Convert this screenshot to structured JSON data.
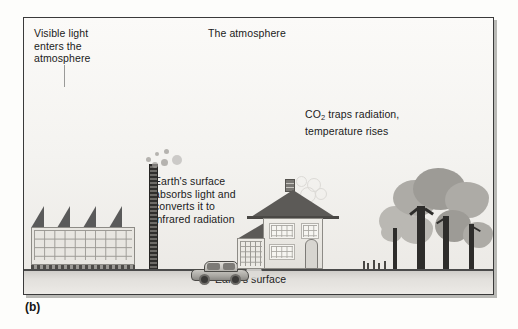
{
  "figure": {
    "caption": "(b)",
    "frame_color": "#3a3a3a",
    "sky_color": "#f7f6f3",
    "ground_color": "#dedcd8"
  },
  "labels": {
    "visible_light": "Visible light\nenters the\natmosphere",
    "atmosphere": "The atmosphere",
    "co2_prefix": "CO",
    "co2_subscript": "2",
    "co2_suffix": " traps radiation,\ntemperature rises",
    "absorb": "Earth's surface\nabsorbs light and\nconverts it to\ninfrared radiation",
    "earth_surface": "Earth's surface"
  },
  "scene": {
    "factory": {
      "name": "factory",
      "roof_teeth": 4,
      "window_columns": 10,
      "window_rows": 4
    },
    "smokestack": {
      "name": "smokestack",
      "puffs": 6
    },
    "car": {
      "name": "car",
      "wheels": 2,
      "direction": "left"
    },
    "house": {
      "name": "house",
      "windows": 3,
      "has_garage": true,
      "has_chimney": true,
      "smoke_rings": 4
    },
    "trees": {
      "name": "trees",
      "count": 4,
      "grass_tufts": 3
    },
    "light_ray": {
      "name": "visible-light-ray"
    }
  }
}
